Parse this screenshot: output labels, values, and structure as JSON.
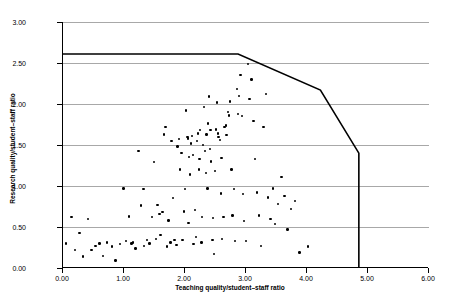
{
  "chart_data": {
    "type": "scatter",
    "title": "",
    "xlabel": "Teaching quality/student–staff ratio",
    "ylabel": "Research quality/student–staff ratio",
    "xlim": [
      0,
      6
    ],
    "ylim": [
      0,
      3
    ],
    "xticks": [
      0,
      1,
      2,
      3,
      4,
      5,
      6
    ],
    "xticklabels": [
      "0.00",
      "1.00",
      "2.00",
      "3.00",
      "4.00",
      "5.00",
      "6.00"
    ],
    "yticks": [
      0,
      0.5,
      1.0,
      1.5,
      2.0,
      2.5,
      3.0
    ],
    "yticklabels": [
      "0.00",
      "0.50",
      "1.00",
      "1.50",
      "2.00",
      "2.50",
      "3.00"
    ],
    "grid": "horizontal",
    "legend": "none",
    "series": [
      {
        "name": "institutions",
        "marker": "filled-circle",
        "color": "#000000",
        "points": [
          [
            0.05,
            0.3
          ],
          [
            0.14,
            0.62
          ],
          [
            0.2,
            0.22
          ],
          [
            0.27,
            0.43
          ],
          [
            0.33,
            0.14
          ],
          [
            0.41,
            0.6
          ],
          [
            0.47,
            0.22
          ],
          [
            0.53,
            0.27
          ],
          [
            0.6,
            0.3
          ],
          [
            0.66,
            0.15
          ],
          [
            0.72,
            0.31
          ],
          [
            0.8,
            0.26
          ],
          [
            0.86,
            0.09
          ],
          [
            0.93,
            0.29
          ],
          [
            0.99,
            0.97
          ],
          [
            1.03,
            0.33
          ],
          [
            1.08,
            0.63
          ],
          [
            1.12,
            0.3
          ],
          [
            1.15,
            0.31
          ],
          [
            1.19,
            0.24
          ],
          [
            1.24,
            1.43
          ],
          [
            1.28,
            0.76
          ],
          [
            1.33,
            0.27
          ],
          [
            1.38,
            0.34
          ],
          [
            1.42,
            0.3
          ],
          [
            1.46,
            0.62
          ],
          [
            1.49,
            1.29
          ],
          [
            1.52,
            0.35
          ],
          [
            1.55,
            0.77
          ],
          [
            1.58,
            0.66
          ],
          [
            1.6,
            0.4
          ],
          [
            1.63,
            0.68
          ],
          [
            1.66,
            1.63
          ],
          [
            1.68,
            1.72
          ],
          [
            1.7,
            0.26
          ],
          [
            1.73,
            0.58
          ],
          [
            1.76,
            0.31
          ],
          [
            1.78,
            1.55
          ],
          [
            1.8,
            0.85
          ],
          [
            1.83,
            0.34
          ],
          [
            1.86,
            0.28
          ],
          [
            1.88,
            1.48
          ],
          [
            1.9,
            1.57
          ],
          [
            1.92,
            1.2
          ],
          [
            1.94,
            1.4
          ],
          [
            1.96,
            0.34
          ],
          [
            1.98,
            0.69
          ],
          [
            2.0,
            0.96
          ],
          [
            2.02,
            1.92
          ],
          [
            2.04,
            1.6
          ],
          [
            2.05,
            1.58
          ],
          [
            2.07,
            1.35
          ],
          [
            2.08,
            1.14
          ],
          [
            2.1,
            1.52
          ],
          [
            2.11,
            1.61
          ],
          [
            2.13,
            1.38
          ],
          [
            2.14,
            0.29
          ],
          [
            2.16,
            0.71
          ],
          [
            2.18,
            0.38
          ],
          [
            2.2,
            1.55
          ],
          [
            2.21,
            1.64
          ],
          [
            2.23,
            1.2
          ],
          [
            2.24,
            1.33
          ],
          [
            2.25,
            1.68
          ],
          [
            2.27,
            0.31
          ],
          [
            2.28,
            0.62
          ],
          [
            2.3,
            1.5
          ],
          [
            2.31,
            1.96
          ],
          [
            2.33,
            1.43
          ],
          [
            2.34,
            1.16
          ],
          [
            2.35,
            1.63
          ],
          [
            2.37,
            0.97
          ],
          [
            2.38,
            1.76
          ],
          [
            2.39,
            2.09
          ],
          [
            2.41,
            1.45
          ],
          [
            2.42,
            1.68
          ],
          [
            2.43,
            1.3
          ],
          [
            2.45,
            0.34
          ],
          [
            2.46,
            0.61
          ],
          [
            2.48,
            0.17
          ],
          [
            2.49,
            1.18
          ],
          [
            2.51,
            1.69
          ],
          [
            2.52,
            2.02
          ],
          [
            2.54,
            1.64
          ],
          [
            2.55,
            1.6
          ],
          [
            2.57,
            1.56
          ],
          [
            2.59,
            0.91
          ],
          [
            2.61,
            0.35
          ],
          [
            2.63,
            0.62
          ],
          [
            2.65,
            1.72
          ],
          [
            2.67,
            1.74
          ],
          [
            2.68,
            1.62
          ],
          [
            2.7,
            1.9
          ],
          [
            2.72,
            1.86
          ],
          [
            2.74,
            2.03
          ],
          [
            2.76,
            1.2
          ],
          [
            2.78,
            0.64
          ],
          [
            2.8,
            0.96
          ],
          [
            2.82,
            0.33
          ],
          [
            2.85,
            2.18
          ],
          [
            2.87,
            1.88
          ],
          [
            2.89,
            2.1
          ],
          [
            2.91,
            2.35
          ],
          [
            2.93,
            1.85
          ],
          [
            2.95,
            0.9
          ],
          [
            2.97,
            0.57
          ],
          [
            3.0,
            0.33
          ],
          [
            3.03,
            2.49
          ],
          [
            3.06,
            2.06
          ],
          [
            3.09,
            2.3
          ],
          [
            3.12,
            1.79
          ],
          [
            3.15,
            1.33
          ],
          [
            3.18,
            0.92
          ],
          [
            3.21,
            0.64
          ],
          [
            3.25,
            0.27
          ],
          [
            3.29,
            1.72
          ],
          [
            3.33,
            2.12
          ],
          [
            3.36,
            0.86
          ],
          [
            3.4,
            0.6
          ],
          [
            3.44,
            0.97
          ],
          [
            3.48,
            0.54
          ],
          [
            3.52,
            0.78
          ],
          [
            3.58,
            1.11
          ],
          [
            3.63,
            0.88
          ],
          [
            3.68,
            0.47
          ],
          [
            3.74,
            0.72
          ],
          [
            3.8,
            0.82
          ],
          [
            3.88,
            0.19
          ],
          [
            4.02,
            0.26
          ],
          [
            1.32,
            0.96
          ],
          [
            2.06,
            0.55
          ],
          [
            2.6,
            1.34
          ]
        ]
      }
    ],
    "frontier": {
      "name": "efficiency frontier",
      "color": "#000000",
      "linewidth": 1.6,
      "vertices": [
        [
          0.0,
          2.61
        ],
        [
          2.87,
          2.61
        ],
        [
          4.22,
          2.17
        ],
        [
          4.85,
          1.4
        ],
        [
          4.85,
          0.0
        ]
      ]
    }
  }
}
